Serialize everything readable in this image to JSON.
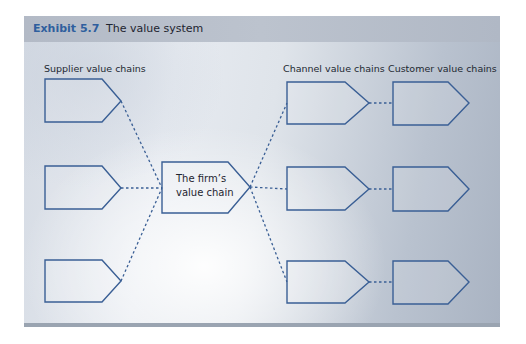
{
  "exhibit": {
    "number": "Exhibit 5.7",
    "title": "The value system"
  },
  "columns": {
    "supplier": "Supplier value chains",
    "channel": "Channel value chains",
    "customer": "Customer value chains"
  },
  "firm": {
    "line1": "The firm’s",
    "line2": "value chain"
  },
  "colors": {
    "accent": "#2f5f9e",
    "shape_stroke": "#3a5f95",
    "connector": "#3a5f95",
    "header_bg": "#b8bfca"
  }
}
